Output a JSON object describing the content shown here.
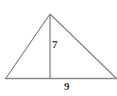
{
  "figure": {
    "kind": "geometry-diagram",
    "shape": "triangle",
    "background_color": "#ffffff",
    "stroke_color": "#7d7d7d",
    "label_color": "#3b3b3b",
    "labels": {
      "altitude": "7",
      "base": "9"
    },
    "vertices": {
      "apex": {
        "x": 50,
        "y": 14
      },
      "left": {
        "x": 6,
        "y": 78
      },
      "right": {
        "x": 116,
        "y": 78
      },
      "foot": {
        "x": 50,
        "y": 78
      }
    },
    "segments": [
      {
        "name": "left-side",
        "from": "left",
        "to": "apex"
      },
      {
        "name": "right-side",
        "from": "apex",
        "to": "right"
      },
      {
        "name": "base",
        "from": "left",
        "to": "right",
        "label": "9"
      },
      {
        "name": "altitude",
        "from": "apex",
        "to": "foot",
        "label": "7"
      }
    ]
  },
  "chart_data": {
    "type": "diagram",
    "title": "",
    "shape": "triangle",
    "measurements": [
      {
        "name": "height",
        "value": 7,
        "label": "7"
      },
      {
        "name": "base",
        "value": 9,
        "label": "9"
      }
    ],
    "annotations": [
      "7",
      "9"
    ]
  }
}
